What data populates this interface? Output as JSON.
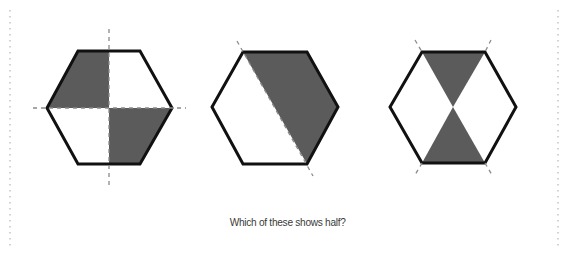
{
  "question": {
    "text": "Which of these shows half?"
  },
  "colors": {
    "shade": "#5b5b5b",
    "outline": "#111111",
    "fold_line": "#8a8a8a",
    "page_border": "#b5b5b5",
    "background": "#ffffff"
  },
  "figures": [
    {
      "id": "hexagon-quarters",
      "description": "Regular hexagon divided into four parts by a vertical and a horizontal dashed line; top-left and bottom-right quarters shaded",
      "shaded_parts": 2,
      "total_parts": 4
    },
    {
      "id": "hexagon-diagonal",
      "description": "Regular hexagon divided by a diagonal dashed line from top-left vertex to bottom-right vertex; right part shaded",
      "shaded_parts": 1,
      "total_parts": 2
    },
    {
      "id": "hexagon-bowtie",
      "description": "Regular hexagon divided by two diagonal dashed lines crossing at the center; top and bottom triangles shaded",
      "shaded_parts": 2,
      "total_parts": 4
    }
  ]
}
